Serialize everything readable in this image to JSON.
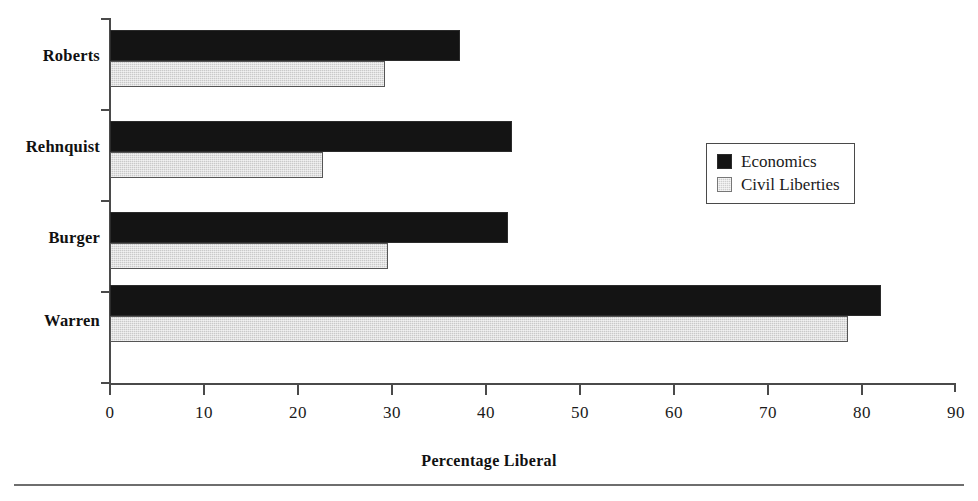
{
  "chart_data": {
    "type": "bar",
    "orientation": "horizontal",
    "title": "",
    "xlabel": "Percentage Liberal",
    "ylabel": "",
    "xlim": [
      0,
      90
    ],
    "xticks": [
      0,
      10,
      20,
      30,
      40,
      50,
      60,
      70,
      80,
      90
    ],
    "grid": false,
    "legend_position": "right-upper",
    "categories": [
      "Roberts",
      "Rehnquist",
      "Burger",
      "Warren"
    ],
    "series": [
      {
        "name": "Economics",
        "color": "#141414",
        "values": [
          37.3,
          42.8,
          42.4,
          82.1
        ]
      },
      {
        "name": "Civil Liberties",
        "color": "#c9c9c9",
        "values": [
          29.3,
          22.7,
          29.6,
          78.6
        ]
      }
    ]
  },
  "axis": {
    "x_title": "Percentage Liberal",
    "tick_labels": [
      "0",
      "10",
      "20",
      "30",
      "40",
      "50",
      "60",
      "70",
      "80",
      "90"
    ]
  },
  "legend": {
    "items": [
      {
        "label": "Economics",
        "swatch": "economics-swatch"
      },
      {
        "label": "Civil Liberties",
        "swatch": "civil-liberties-swatch"
      }
    ]
  },
  "categories": [
    {
      "label": "Roberts"
    },
    {
      "label": "Rehnquist"
    },
    {
      "label": "Burger"
    },
    {
      "label": "Warren"
    }
  ]
}
